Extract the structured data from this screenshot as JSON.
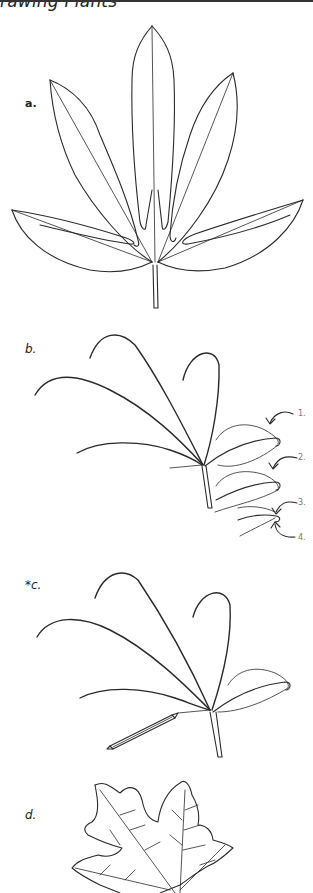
{
  "header": {
    "title": "rawing Plants"
  },
  "figures": [
    {
      "id": "a",
      "label": "a.",
      "description": "completed palmate leaf with seven leaflets outlined"
    },
    {
      "id": "b",
      "label": "b.",
      "description": "gesture lines of leaflets with numbered steps",
      "callouts": [
        "1.",
        "2.",
        "3.",
        "4."
      ]
    },
    {
      "id": "c",
      "label": "*c.",
      "description": "gesture lines of leaf with pencil"
    },
    {
      "id": "d",
      "label": "d.",
      "description": "maple leaf with veins"
    }
  ]
}
